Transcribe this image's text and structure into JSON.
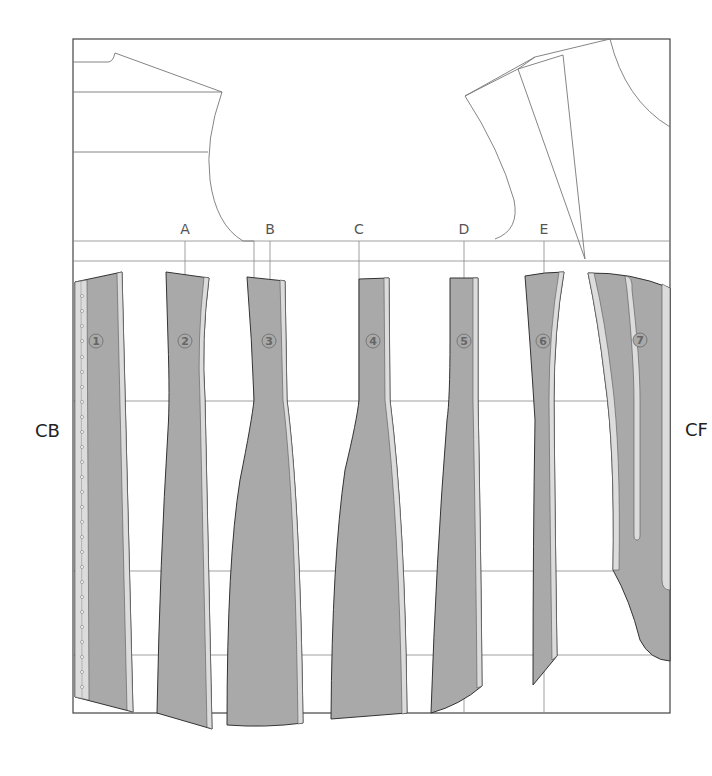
{
  "labels": {
    "center_back": "CB",
    "center_front": "CF"
  },
  "columns": [
    {
      "id": "A",
      "label": "A",
      "x": 185
    },
    {
      "id": "B",
      "label": "B",
      "x": 270
    },
    {
      "id": "C",
      "label": "C",
      "x": 359
    },
    {
      "id": "D",
      "label": "D",
      "x": 464
    },
    {
      "id": "E",
      "label": "E",
      "x": 544
    }
  ],
  "panels": [
    {
      "number": "1",
      "cx": 96,
      "cy": 341
    },
    {
      "number": "2",
      "cx": 185,
      "cy": 341
    },
    {
      "number": "3",
      "cx": 269,
      "cy": 341
    },
    {
      "number": "4",
      "cx": 373,
      "cy": 341
    },
    {
      "number": "5",
      "cx": 464,
      "cy": 341
    },
    {
      "number": "6",
      "cx": 543,
      "cy": 341
    },
    {
      "number": "7",
      "cx": 640,
      "cy": 340
    }
  ],
  "colors": {
    "panel_fill": "#a9a9a9",
    "seam_allowance": "#dcdcdc",
    "outline": "#333333",
    "guide": "#888888"
  }
}
